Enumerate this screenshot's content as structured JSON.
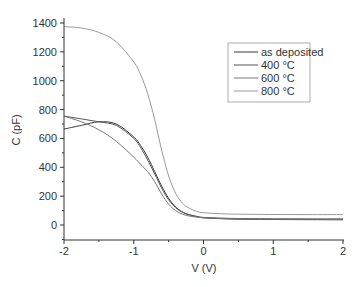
{
  "chart_data": {
    "type": "line",
    "title": "",
    "xlabel": "V (V)",
    "ylabel": "C (pF)",
    "xlim": [
      -2,
      2
    ],
    "ylim": [
      -100,
      1500
    ],
    "xticks": [
      -2,
      -1,
      0,
      1,
      2
    ],
    "xtick_labels": [
      "-2",
      "-1",
      "0",
      "1",
      "2"
    ],
    "yticks": [
      0,
      200,
      400,
      600,
      800,
      1000,
      1200,
      1400
    ],
    "ytick_labels": [
      "0",
      "200",
      "400",
      "600",
      "800",
      "1000",
      "1200",
      "1400"
    ],
    "grid": false,
    "legend_position": "upper right",
    "x": [
      -2.0,
      -1.75,
      -1.5,
      -1.25,
      -1.0,
      -0.9,
      -0.8,
      -0.7,
      -0.6,
      -0.5,
      -0.4,
      -0.3,
      -0.2,
      -0.1,
      0.0,
      0.25,
      0.5,
      1.0,
      1.5,
      2.0
    ],
    "series": [
      {
        "name": "as deposited",
        "color": "#3a3a3a",
        "values": [
          665,
          690,
          715,
          700,
          610,
          550,
          470,
          370,
          270,
          185,
          125,
          90,
          70,
          58,
          50,
          44,
          40,
          38,
          37,
          36
        ]
      },
      {
        "name": "400 °C",
        "color": "#555555",
        "values": [
          755,
          735,
          715,
          690,
          600,
          535,
          450,
          355,
          255,
          175,
          120,
          88,
          70,
          60,
          53,
          48,
          45,
          43,
          42,
          42
        ]
      },
      {
        "name": "600 °C",
        "color": "#777777",
        "values": [
          755,
          715,
          660,
          580,
          470,
          420,
          370,
          300,
          215,
          145,
          100,
          75,
          62,
          55,
          50,
          45,
          42,
          40,
          40,
          40
        ]
      },
      {
        "name": "800 °C",
        "color": "#999999",
        "values": [
          1375,
          1365,
          1335,
          1270,
          1130,
          1040,
          910,
          730,
          520,
          340,
          220,
          150,
          115,
          95,
          85,
          78,
          75,
          73,
          72,
          72
        ]
      }
    ]
  }
}
